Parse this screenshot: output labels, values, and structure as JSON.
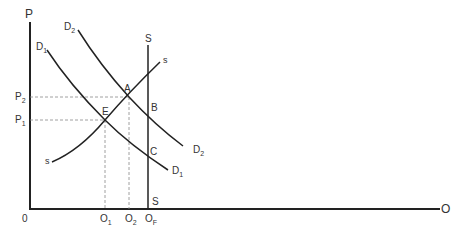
{
  "axes": {
    "y_label": "P",
    "x_label": "O",
    "origin_label": "0"
  },
  "price_labels": [
    {
      "main": "P",
      "sub": "2",
      "name": "p2"
    },
    {
      "main": "P",
      "sub": "1",
      "name": "p1"
    }
  ],
  "quantity_labels": [
    {
      "main": "O",
      "sub": "1",
      "name": "o1"
    },
    {
      "main": "O",
      "sub": "2",
      "name": "o2"
    },
    {
      "main": "O",
      "sub": "F",
      "name": "of"
    }
  ],
  "curves": {
    "d2_top": {
      "main": "D",
      "sub": "2"
    },
    "d1_top": {
      "main": "D",
      "sub": "1"
    },
    "d2_end": {
      "main": "D",
      "sub": "2"
    },
    "d1_end": {
      "main": "D",
      "sub": "1"
    },
    "s_fixed_top": "S",
    "s_fixed_bottom": "S",
    "s_short_top": "s",
    "s_short_bottom": "s"
  },
  "points": {
    "a": "A",
    "b": "B",
    "c": "C",
    "e": "E"
  },
  "colors": {
    "line": "#222222",
    "dashed": "#888888",
    "text": "#333333"
  }
}
